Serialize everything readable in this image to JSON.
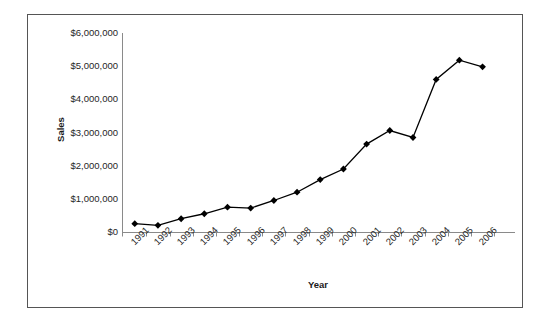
{
  "chart_data": {
    "type": "line",
    "title": "",
    "xlabel": "Year",
    "ylabel": "Sales",
    "categories": [
      "1991",
      "1992",
      "1993",
      "1994",
      "1995",
      "1996",
      "1997",
      "1998",
      "1999",
      "2000",
      "2001",
      "2002",
      "2003",
      "2004",
      "2005",
      "2006"
    ],
    "values": [
      250000,
      200000,
      400000,
      550000,
      750000,
      720000,
      950000,
      1200000,
      1580000,
      1900000,
      2650000,
      3060000,
      2850000,
      4600000,
      5180000,
      4980000
    ],
    "series": [
      {
        "name": "Sales",
        "values": [
          250000,
          200000,
          400000,
          550000,
          750000,
          720000,
          950000,
          1200000,
          1580000,
          1900000,
          2650000,
          3060000,
          2850000,
          4600000,
          5180000,
          4980000
        ]
      }
    ],
    "ylim": [
      0,
      6000000
    ],
    "ytick_values": [
      0,
      1000000,
      2000000,
      3000000,
      4000000,
      5000000,
      6000000
    ],
    "ytick_labels": [
      "$0",
      "$1,000,000",
      "$2,000,000",
      "$3,000,000",
      "$4,000,000",
      "$5,000,000",
      "$6,000,000"
    ],
    "xtick_labels": [
      "1991",
      "1992",
      "1993",
      "1994",
      "1995",
      "1996",
      "1997",
      "1998",
      "1999",
      "2000",
      "2001",
      "2002",
      "2003",
      "2004",
      "2005",
      "2006"
    ],
    "grid": false,
    "legend": null,
    "legend_position": "none",
    "marker": "diamond",
    "marker_color": "#000000",
    "line_color": "#000000",
    "plot_background": "#ffffff",
    "frame_color": "#555555",
    "axis_color": "#808080"
  },
  "axis_titles": {
    "y": "Sales",
    "x": "Year"
  }
}
